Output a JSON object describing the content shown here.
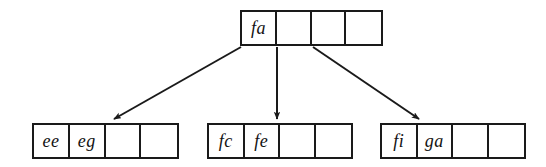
{
  "diagram": {
    "type": "b-tree",
    "title": "",
    "background_color": "#ffffff",
    "line_color": "#1a1a1a",
    "text_color": "#121212",
    "nodes": [
      {
        "id": "root",
        "role": "root-node",
        "cells": [
          "fa",
          "",
          "",
          ""
        ],
        "capacity": 4,
        "filled": 1
      },
      {
        "id": "leaf-0",
        "role": "leaf-node",
        "cells": [
          "ee",
          "eg",
          "",
          ""
        ],
        "capacity": 4,
        "filled": 2
      },
      {
        "id": "leaf-1",
        "role": "leaf-node",
        "cells": [
          "fc",
          "fe",
          "",
          ""
        ],
        "capacity": 4,
        "filled": 2
      },
      {
        "id": "leaf-2",
        "role": "leaf-node",
        "cells": [
          "fi",
          "ga",
          "",
          ""
        ],
        "capacity": 4,
        "filled": 2
      }
    ],
    "edges": [
      {
        "id": "edge-left",
        "from": "root",
        "to": "leaf-0",
        "style": "arrow"
      },
      {
        "id": "edge-middle",
        "from": "root",
        "to": "leaf-1",
        "style": "arrow"
      },
      {
        "id": "edge-right",
        "from": "root",
        "to": "leaf-2",
        "style": "arrow"
      }
    ]
  }
}
